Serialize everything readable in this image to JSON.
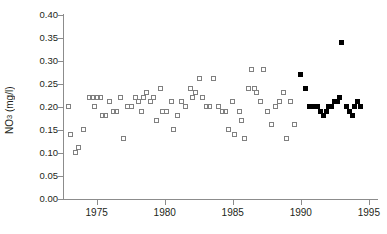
{
  "chart_data": {
    "type": "scatter",
    "title": "",
    "xlabel": "",
    "ylabel": "NO3 (mg/l)",
    "ylabel_base": "NO",
    "ylabel_sub": "3",
    "ylabel_unit": " (mg/l)",
    "xlim": [
      1972.6,
      1995.6
    ],
    "ylim": [
      0.0,
      0.4
    ],
    "ytick_labels": [
      "0.40",
      "0.35",
      "0.30",
      "0.25",
      "0.20",
      "0.15",
      "0.10",
      "0.05",
      "0.00"
    ],
    "ytick_values": [
      0.4,
      0.35,
      0.3,
      0.25,
      0.2,
      0.15,
      0.1,
      0.05,
      0.0
    ],
    "xtick_labels": [
      "1975",
      "1980",
      "1985",
      "1990",
      "1995"
    ],
    "xtick_values": [
      1975,
      1980,
      1985,
      1990,
      1995
    ],
    "grid": false,
    "legend": "none",
    "series": [
      {
        "name": "open-squares",
        "marker": "open-square",
        "color": "#808080",
        "points": [
          [
            1973.0,
            0.2
          ],
          [
            1973.1,
            0.14
          ],
          [
            1973.5,
            0.1
          ],
          [
            1973.7,
            0.11
          ],
          [
            1974.1,
            0.15
          ],
          [
            1974.5,
            0.22
          ],
          [
            1974.7,
            0.22
          ],
          [
            1974.9,
            0.2
          ],
          [
            1975.1,
            0.22
          ],
          [
            1975.3,
            0.22
          ],
          [
            1975.5,
            0.18
          ],
          [
            1975.7,
            0.18
          ],
          [
            1976.0,
            0.21
          ],
          [
            1976.3,
            0.19
          ],
          [
            1976.5,
            0.19
          ],
          [
            1976.8,
            0.22
          ],
          [
            1977.0,
            0.13
          ],
          [
            1977.3,
            0.2
          ],
          [
            1977.6,
            0.2
          ],
          [
            1977.9,
            0.22
          ],
          [
            1978.1,
            0.21
          ],
          [
            1978.3,
            0.19
          ],
          [
            1978.5,
            0.22
          ],
          [
            1978.7,
            0.23
          ],
          [
            1979.0,
            0.21
          ],
          [
            1979.2,
            0.22
          ],
          [
            1979.4,
            0.17
          ],
          [
            1979.7,
            0.24
          ],
          [
            1979.9,
            0.19
          ],
          [
            1980.2,
            0.19
          ],
          [
            1980.5,
            0.21
          ],
          [
            1980.7,
            0.15
          ],
          [
            1981.0,
            0.18
          ],
          [
            1981.3,
            0.21
          ],
          [
            1981.6,
            0.2
          ],
          [
            1981.9,
            0.24
          ],
          [
            1982.1,
            0.22
          ],
          [
            1982.3,
            0.23
          ],
          [
            1982.6,
            0.26
          ],
          [
            1982.8,
            0.22
          ],
          [
            1983.1,
            0.2
          ],
          [
            1983.3,
            0.2
          ],
          [
            1983.6,
            0.26
          ],
          [
            1984.0,
            0.2
          ],
          [
            1984.3,
            0.19
          ],
          [
            1984.5,
            0.19
          ],
          [
            1984.7,
            0.15
          ],
          [
            1985.0,
            0.21
          ],
          [
            1985.2,
            0.14
          ],
          [
            1985.5,
            0.19
          ],
          [
            1985.7,
            0.17
          ],
          [
            1985.9,
            0.13
          ],
          [
            1986.2,
            0.24
          ],
          [
            1986.4,
            0.28
          ],
          [
            1986.6,
            0.24
          ],
          [
            1986.8,
            0.23
          ],
          [
            1987.1,
            0.21
          ],
          [
            1987.3,
            0.28
          ],
          [
            1987.6,
            0.19
          ],
          [
            1987.9,
            0.16
          ],
          [
            1988.2,
            0.2
          ],
          [
            1988.5,
            0.21
          ],
          [
            1988.8,
            0.23
          ],
          [
            1989.0,
            0.13
          ],
          [
            1989.3,
            0.21
          ],
          [
            1989.6,
            0.16
          ]
        ]
      },
      {
        "name": "filled-squares",
        "marker": "filled-square",
        "color": "#000000",
        "points": [
          [
            1990.0,
            0.27
          ],
          [
            1990.4,
            0.24
          ],
          [
            1990.7,
            0.2
          ],
          [
            1990.9,
            0.2
          ],
          [
            1991.1,
            0.2
          ],
          [
            1991.3,
            0.2
          ],
          [
            1991.5,
            0.19
          ],
          [
            1991.7,
            0.18
          ],
          [
            1991.9,
            0.19
          ],
          [
            1992.1,
            0.2
          ],
          [
            1992.3,
            0.2
          ],
          [
            1992.5,
            0.21
          ],
          [
            1992.7,
            0.21
          ],
          [
            1992.9,
            0.22
          ],
          [
            1993.0,
            0.34
          ],
          [
            1993.4,
            0.2
          ],
          [
            1993.6,
            0.19
          ],
          [
            1993.8,
            0.18
          ],
          [
            1994.0,
            0.2
          ],
          [
            1994.2,
            0.21
          ],
          [
            1994.4,
            0.2
          ]
        ]
      }
    ]
  }
}
